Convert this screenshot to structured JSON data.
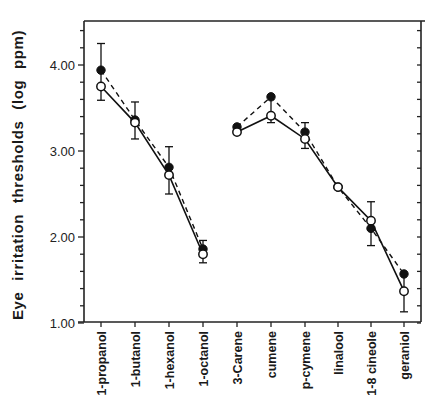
{
  "chart_data": {
    "type": "line",
    "title": "",
    "xlabel": "",
    "ylabel": "Eye irritation thresholds (log ppm)",
    "ylim": [
      1.0,
      4.5
    ],
    "yticks": [
      {
        "value": 1.0,
        "label": "1.00"
      },
      {
        "value": 2.0,
        "label": "2.00"
      },
      {
        "value": 3.0,
        "label": "3.00"
      },
      {
        "value": 4.0,
        "label": "4.00"
      }
    ],
    "minor_tick_step": 0.2,
    "grid": false,
    "legend": null,
    "categories": [
      "1-propanol",
      "1-butanol",
      "1-hexanol",
      "1-octanol",
      "3-Carene",
      "cumene",
      "p-cymene",
      "linalool",
      "1-8 cineole",
      "geraniol"
    ],
    "groups": [
      {
        "name": "alcohols",
        "indices": [
          0,
          1,
          2,
          3
        ]
      },
      {
        "name": "terpenes",
        "indices": [
          4,
          5,
          6,
          7,
          8,
          9
        ]
      }
    ],
    "series": [
      {
        "name": "filled circles (dashed line)",
        "marker": "filled-circle",
        "line": "dashed",
        "values": [
          3.94,
          3.36,
          2.81,
          1.86,
          3.28,
          3.63,
          3.22,
          2.58,
          2.1,
          1.57
        ]
      },
      {
        "name": "open circles (solid line)",
        "marker": "open-circle",
        "line": "solid",
        "values": [
          3.75,
          3.33,
          2.72,
          1.8,
          3.22,
          3.41,
          3.14,
          2.58,
          2.19,
          1.37
        ]
      }
    ],
    "error_bars": [
      {
        "category": "1-propanol",
        "high": 4.25,
        "low": 3.59
      },
      {
        "category": "1-butanol",
        "high": 3.57,
        "low": 3.14
      },
      {
        "category": "1-hexanol",
        "high": 3.05,
        "low": 2.5
      },
      {
        "category": "1-octanol",
        "high": 1.96,
        "low": 1.7
      },
      {
        "category": "cumene",
        "high": null,
        "low": 3.33
      },
      {
        "category": "p-cymene",
        "high": 3.33,
        "low": 3.03
      },
      {
        "category": "1-8 cineole",
        "high": 2.41,
        "low": 1.9
      },
      {
        "category": "geraniol",
        "high": null,
        "low": 1.13
      }
    ]
  },
  "layout": {
    "plot_left": 84,
    "plot_right": 421,
    "plot_top": 21,
    "plot_bottom": 322,
    "x_positions": [
      101,
      135,
      169,
      203,
      237,
      271,
      305,
      338,
      371,
      404
    ],
    "px_per_unit": 86,
    "y_at_1": 323
  }
}
